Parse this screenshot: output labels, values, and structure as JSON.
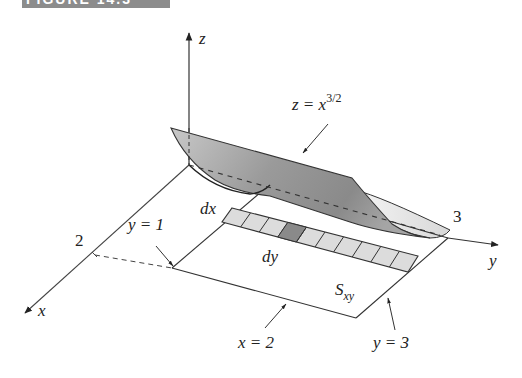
{
  "banner": {
    "text": "FIGURE 14.3"
  },
  "axes": {
    "z_label": "z",
    "y_label": "y",
    "x_label": "x",
    "x_tick": "2",
    "y_tick": "3"
  },
  "annotations": {
    "surface_eq_lhs": "z = x",
    "surface_eq_exp": "3/2",
    "y1": "y = 1",
    "y3": "y = 3",
    "x2": "x = 2",
    "dx": "dx",
    "dy": "dy",
    "region_main": "S",
    "region_sub": "xy"
  },
  "strip": {
    "cells": 10,
    "highlighted_index": 3
  },
  "colors": {
    "line": "#333333",
    "cell_fill": "#dcdcdc",
    "cell_highlight": "#8a8a8a",
    "surface_dark": "#8f8f8f",
    "surface_light": "#e6e6e6"
  }
}
